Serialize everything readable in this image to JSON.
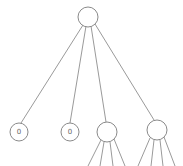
{
  "diagram": {
    "type": "tree",
    "colors": {
      "edge": "#9a9a9a",
      "node_stroke": "#8a8a8a",
      "node_fill": "#ffffff",
      "label": "#666666"
    },
    "root": {
      "id": "root",
      "label": ""
    },
    "children": [
      {
        "id": "leaf-1",
        "label": "0",
        "has_children": false
      },
      {
        "id": "leaf-2",
        "label": "0",
        "has_children": false
      },
      {
        "id": "node-3",
        "label": "",
        "has_children": true,
        "child_edge_count": 4
      },
      {
        "id": "node-4",
        "label": "",
        "has_children": true,
        "child_edge_count": 4
      }
    ]
  }
}
